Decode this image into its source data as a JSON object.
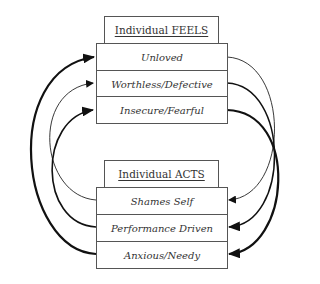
{
  "feels": {
    "title": "Individual FEELS",
    "items": [
      "Unloved",
      "Worthless/Defective",
      "Insecure/Fearful"
    ]
  },
  "acts": {
    "title": "Individual ACTS",
    "items": [
      "Shames Self",
      "Performance Driven",
      "Anxious/Needy"
    ]
  },
  "arrows": [
    {
      "from": "Anxious/Needy",
      "to": "Unloved",
      "side": "left",
      "weight": "thick"
    },
    {
      "from": "Shames Self",
      "to": "Worthless/Defective",
      "side": "left",
      "weight": "thin"
    },
    {
      "from": "Performance Driven",
      "to": "Insecure/Fearful",
      "side": "left",
      "weight": "medium"
    },
    {
      "from": "Unloved",
      "to": "Shames Self",
      "side": "right",
      "weight": "thin"
    },
    {
      "from": "Worthless/Defective",
      "to": "Performance Driven",
      "side": "right",
      "weight": "medium"
    },
    {
      "from": "Insecure/Fearful",
      "to": "Anxious/Needy",
      "side": "right",
      "weight": "thick"
    }
  ]
}
